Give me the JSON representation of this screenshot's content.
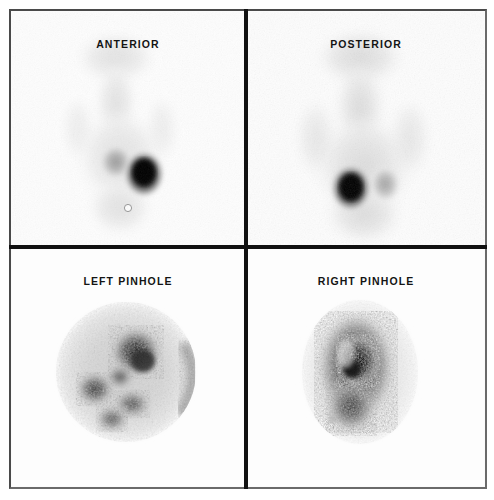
{
  "figure": {
    "type": "nuclear-medicine-scintigraphy-montage",
    "layout": "2x2",
    "modality": "Planar gamma camera scintigraphy (parathyroid / thyroid imaging)",
    "background_color": "#fdfdfd",
    "frame_color": "#4a4a4a",
    "divider_color": "#111111",
    "label_color": "#141414"
  },
  "panels": [
    {
      "id": "anterior",
      "label": "ANTERIOR",
      "position": "top-left",
      "view": "whole-body anterior planar view",
      "field_shape": "rectangular",
      "findings": [
        {
          "name": "intense focal uptake",
          "intensity": "very high",
          "cx": 132,
          "cy": 162,
          "rx": 20,
          "ry": 23
        },
        {
          "name": "faint contralateral lobe",
          "intensity": "low",
          "cx": 104,
          "cy": 150,
          "rx": 17,
          "ry": 18
        },
        {
          "name": "faint neck/body silhouette",
          "intensity": "very low"
        },
        {
          "name": "skin marker dot",
          "intensity": "marker",
          "cx": 116,
          "cy": 196,
          "rx": 3,
          "ry": 3
        }
      ]
    },
    {
      "id": "posterior",
      "label": "POSTERIOR",
      "position": "top-right",
      "view": "whole-body posterior planar view",
      "field_shape": "rectangular",
      "findings": [
        {
          "name": "intense focal uptake",
          "intensity": "very high",
          "cx": 350,
          "cy": 176,
          "rx": 20,
          "ry": 23
        },
        {
          "name": "faint contralateral lobe",
          "intensity": "low",
          "cx": 384,
          "cy": 172,
          "rx": 15,
          "ry": 18
        },
        {
          "name": "faint neck/body silhouette",
          "intensity": "very low"
        }
      ]
    },
    {
      "id": "left-pinhole",
      "label": "LEFT PINHOLE",
      "position": "bottom-left",
      "view": "pinhole collimator magnified view, left",
      "field_shape": "circular",
      "field_center_x": 126,
      "field_center_y": 372,
      "field_radius": 70,
      "findings": [
        {
          "name": "mottled heterogeneous uptake",
          "intensity": "moderate"
        },
        {
          "name": "upper central hot focus",
          "intensity": "high",
          "cx": 136,
          "cy": 352,
          "rx": 22,
          "ry": 22
        },
        {
          "name": "left lateral hot focus",
          "intensity": "high",
          "cx": 95,
          "cy": 390,
          "rx": 15,
          "ry": 14
        },
        {
          "name": "inferior hot focus",
          "intensity": "moderate",
          "cx": 120,
          "cy": 420,
          "rx": 14,
          "ry": 12
        },
        {
          "name": "rim edge activity",
          "intensity": "moderate"
        }
      ]
    },
    {
      "id": "right-pinhole",
      "label": "RIGHT PINHOLE",
      "position": "bottom-right",
      "view": "pinhole collimator magnified view, right",
      "field_shape": "oval",
      "field_center_x": 360,
      "field_center_y": 372,
      "field_radius": 68,
      "findings": [
        {
          "name": "vertically oriented oval uptake mass",
          "intensity": "high",
          "cx": 355,
          "cy": 372,
          "rx": 38,
          "ry": 55
        },
        {
          "name": "central dense core",
          "intensity": "very high",
          "cx": 355,
          "cy": 362,
          "rx": 20,
          "ry": 24
        },
        {
          "name": "faint lateral speck",
          "intensity": "very low",
          "cx": 333,
          "cy": 420,
          "rx": 4,
          "ry": 4
        }
      ]
    }
  ]
}
